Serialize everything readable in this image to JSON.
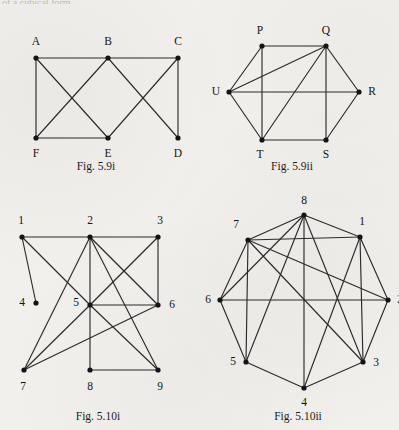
{
  "page": {
    "background_color": "#f2f0ec",
    "ink_color": "#2b2b2b",
    "top_partial_text": "of a cubical form."
  },
  "figures": [
    {
      "id": "fig-5-9i",
      "caption": "Fig. 5.9i",
      "caption_x": 96,
      "caption_y": 160,
      "origin_x": 18,
      "origin_y": 20,
      "width": 180,
      "height": 135,
      "chart_data": {
        "type": "diagram",
        "subtype": "graph",
        "title": "Fig. 5.9i",
        "node_count": 6,
        "edge_count": 8,
        "nodes": [
          {
            "id": "A",
            "label": "A",
            "x": 18,
            "y": 38,
            "label_x": 18,
            "label_y": 22
          },
          {
            "id": "B",
            "label": "B",
            "x": 90,
            "y": 38,
            "label_x": 90,
            "label_y": 22
          },
          {
            "id": "C",
            "label": "C",
            "x": 160,
            "y": 38,
            "label_x": 160,
            "label_y": 22
          },
          {
            "id": "F",
            "label": "F",
            "x": 18,
            "y": 118,
            "label_x": 18,
            "label_y": 134
          },
          {
            "id": "E",
            "label": "E",
            "x": 90,
            "y": 118,
            "label_x": 90,
            "label_y": 134
          },
          {
            "id": "D",
            "label": "D",
            "x": 160,
            "y": 118,
            "label_x": 160,
            "label_y": 134
          }
        ],
        "edges": [
          [
            "A",
            "B"
          ],
          [
            "B",
            "C"
          ],
          [
            "A",
            "F"
          ],
          [
            "F",
            "E"
          ],
          [
            "C",
            "D"
          ],
          [
            "A",
            "E"
          ],
          [
            "B",
            "F"
          ],
          [
            "B",
            "D"
          ],
          [
            "C",
            "E"
          ]
        ]
      }
    },
    {
      "id": "fig-5-9ii",
      "caption": "Fig. 5.9ii",
      "caption_x": 292,
      "caption_y": 160,
      "origin_x": 222,
      "origin_y": 20,
      "width": 160,
      "height": 135,
      "chart_data": {
        "type": "diagram",
        "subtype": "graph",
        "title": "Fig. 5.9ii",
        "node_count": 6,
        "edge_count": 11,
        "nodes": [
          {
            "id": "P",
            "label": "P",
            "x": 40,
            "y": 26,
            "label_x": 38,
            "label_y": 11
          },
          {
            "id": "Q",
            "label": "Q",
            "x": 104,
            "y": 26,
            "label_x": 104,
            "label_y": 11
          },
          {
            "id": "R",
            "label": "R",
            "x": 137,
            "y": 72,
            "label_x": 150,
            "label_y": 72
          },
          {
            "id": "S",
            "label": "S",
            "x": 104,
            "y": 120,
            "label_x": 104,
            "label_y": 135
          },
          {
            "id": "T",
            "label": "T",
            "x": 40,
            "y": 120,
            "label_x": 38,
            "label_y": 135
          },
          {
            "id": "U",
            "label": "U",
            "x": 7,
            "y": 72,
            "label_x": -6,
            "label_y": 72
          }
        ],
        "edges": [
          [
            "P",
            "Q"
          ],
          [
            "Q",
            "R"
          ],
          [
            "R",
            "S"
          ],
          [
            "S",
            "T"
          ],
          [
            "T",
            "U"
          ],
          [
            "U",
            "P"
          ],
          [
            "U",
            "Q"
          ],
          [
            "U",
            "R"
          ],
          [
            "Q",
            "T"
          ],
          [
            "Q",
            "S"
          ],
          [
            "P",
            "T"
          ]
        ]
      }
    },
    {
      "id": "fig-5-10i",
      "caption": "Fig. 5.10i",
      "caption_x": 98,
      "caption_y": 410,
      "origin_x": 18,
      "origin_y": 215,
      "width": 180,
      "height": 185,
      "chart_data": {
        "type": "diagram",
        "subtype": "graph",
        "title": "Fig. 5.10i",
        "node_count": 9,
        "edge_count": 16,
        "nodes": [
          {
            "id": "1",
            "label": "1",
            "x": 4,
            "y": 22,
            "label_x": 3,
            "label_y": 6
          },
          {
            "id": "2",
            "label": "2",
            "x": 72,
            "y": 22,
            "label_x": 72,
            "label_y": 6
          },
          {
            "id": "3",
            "label": "3",
            "x": 140,
            "y": 22,
            "label_x": 142,
            "label_y": 6
          },
          {
            "id": "4",
            "label": "4",
            "x": 18,
            "y": 88,
            "label_x": 4,
            "label_y": 88
          },
          {
            "id": "5",
            "label": "5",
            "x": 72,
            "y": 90,
            "label_x": 58,
            "label_y": 88
          },
          {
            "id": "6",
            "label": "6",
            "x": 140,
            "y": 90,
            "label_x": 154,
            "label_y": 90
          },
          {
            "id": "7",
            "label": "7",
            "x": 6,
            "y": 155,
            "label_x": 5,
            "label_y": 172
          },
          {
            "id": "8",
            "label": "8",
            "x": 72,
            "y": 155,
            "label_x": 72,
            "label_y": 172
          },
          {
            "id": "9",
            "label": "9",
            "x": 140,
            "y": 155,
            "label_x": 142,
            "label_y": 172
          }
        ],
        "edges": [
          [
            "1",
            "2"
          ],
          [
            "2",
            "3"
          ],
          [
            "1",
            "4"
          ],
          [
            "1",
            "5"
          ],
          [
            "2",
            "5"
          ],
          [
            "2",
            "6"
          ],
          [
            "2",
            "7"
          ],
          [
            "2",
            "9"
          ],
          [
            "3",
            "5"
          ],
          [
            "3",
            "6"
          ],
          [
            "5",
            "6"
          ],
          [
            "5",
            "7"
          ],
          [
            "5",
            "8"
          ],
          [
            "5",
            "9"
          ],
          [
            "6",
            "7"
          ],
          [
            "8",
            "9"
          ]
        ]
      }
    },
    {
      "id": "fig-5-10ii",
      "caption": "Fig. 5.10ii",
      "caption_x": 298,
      "caption_y": 410,
      "origin_x": 208,
      "origin_y": 200,
      "width": 180,
      "height": 200,
      "chart_data": {
        "type": "diagram",
        "subtype": "graph",
        "title": "Fig. 5.10ii",
        "node_count": 8,
        "edge_count": 18,
        "nodes": [
          {
            "id": "8",
            "label": "8",
            "x": 96,
            "y": 15,
            "label_x": 96,
            "label_y": 1
          },
          {
            "id": "1",
            "label": "1",
            "x": 152,
            "y": 37,
            "label_x": 154,
            "label_y": 22
          },
          {
            "id": "2",
            "label": "2",
            "x": 180,
            "y": 100,
            "label_x": 192,
            "label_y": 100
          },
          {
            "id": "3",
            "label": "3",
            "x": 155,
            "y": 162,
            "label_x": 168,
            "label_y": 163
          },
          {
            "id": "4",
            "label": "4",
            "x": 96,
            "y": 188,
            "label_x": 96,
            "label_y": 203
          },
          {
            "id": "5",
            "label": "5",
            "x": 38,
            "y": 162,
            "label_x": 25,
            "label_y": 162
          },
          {
            "id": "6",
            "label": "6",
            "x": 12,
            "y": 100,
            "label_x": 0,
            "label_y": 100
          },
          {
            "id": "7",
            "label": "7",
            "x": 40,
            "y": 40,
            "label_x": 28,
            "label_y": 25
          }
        ],
        "edges": [
          [
            "8",
            "7"
          ],
          [
            "8",
            "1"
          ],
          [
            "8",
            "6"
          ],
          [
            "8",
            "5"
          ],
          [
            "8",
            "4"
          ],
          [
            "8",
            "3"
          ],
          [
            "1",
            "2"
          ],
          [
            "1",
            "3"
          ],
          [
            "1",
            "4"
          ],
          [
            "1",
            "7"
          ],
          [
            "2",
            "3"
          ],
          [
            "2",
            "6"
          ],
          [
            "2",
            "7"
          ],
          [
            "3",
            "4"
          ],
          [
            "3",
            "7"
          ],
          [
            "4",
            "5"
          ],
          [
            "5",
            "6"
          ],
          [
            "5",
            "7"
          ],
          [
            "6",
            "7"
          ]
        ]
      }
    }
  ]
}
